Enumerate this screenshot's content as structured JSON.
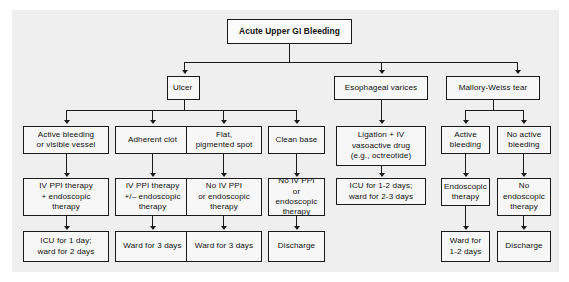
{
  "diagram": {
    "title": "Acute Upper GI Bleeding",
    "background_color": "#efefef",
    "box_fill": "#f7f7f7",
    "line_color": "#1a1a1a",
    "root": {
      "label": "Acute Upper GI Bleeding"
    },
    "categories": [
      {
        "id": "ulcer",
        "label": "Ulcer"
      },
      {
        "id": "varices",
        "label": "Esophageal varices"
      },
      {
        "id": "mallory",
        "label": "Mallory-Weiss tear"
      }
    ],
    "ulcer_findings": [
      {
        "id": "active-bleeding",
        "label": "Active bleeding\nor visible vessel"
      },
      {
        "id": "adherent-clot",
        "label": "Adherent clot"
      },
      {
        "id": "flat-spot",
        "label": "Flat,\npigmented spot"
      },
      {
        "id": "clean-base",
        "label": "Clean base"
      }
    ],
    "ulcer_treatments": [
      {
        "id": "ivppi-endo",
        "label": "IV PPI therapy\n+ endoscopic\ntherapy"
      },
      {
        "id": "ivppi-plusminus",
        "label": "IV PPI therapy\n+/– endoscopic\ntherapy"
      },
      {
        "id": "no-ivppi-1",
        "label": "No IV PPI\nor endoscopic\ntherapy"
      },
      {
        "id": "no-ivppi-2",
        "label": "No IV PPI\nor endoscopic\ntherapy"
      }
    ],
    "ulcer_dispositions": [
      {
        "id": "icu-1-day",
        "label": "ICU for 1 day;\nward for 2 days"
      },
      {
        "id": "ward-3-days-a",
        "label": "Ward for 3 days"
      },
      {
        "id": "ward-3-days-b",
        "label": "Ward for 3 days"
      },
      {
        "id": "discharge-ulcer",
        "label": "Discharge"
      }
    ],
    "varices_treatment": {
      "id": "ligation",
      "label": "Ligation + IV\nvasoactive drug\n(e.g., octreotide)"
    },
    "varices_disposition": {
      "id": "icu-1-2-days",
      "label": "ICU for 1-2 days;\nward for 2-3 days"
    },
    "mallory_findings": [
      {
        "id": "mw-active-bleeding",
        "label": "Active\nbleeding"
      },
      {
        "id": "mw-no-active-bleeding",
        "label": "No active\nbleeding"
      }
    ],
    "mallory_treatments": [
      {
        "id": "mw-endoscopic",
        "label": "Endoscopic\ntherapy"
      },
      {
        "id": "mw-no-endoscopic",
        "label": "No\nendoscopic\ntherapy"
      }
    ],
    "mallory_dispositions": [
      {
        "id": "mw-ward",
        "label": "Ward for\n1-2 days"
      },
      {
        "id": "mw-discharge",
        "label": "Discharge"
      }
    ]
  }
}
